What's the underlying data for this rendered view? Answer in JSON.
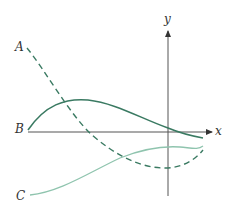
{
  "diagram": {
    "labels": {
      "curve_a": "A",
      "curve_b": "B",
      "curve_c": "C",
      "x_axis": "x",
      "y_axis": "y"
    },
    "colors": {
      "axis": "#555555",
      "curve_a": "#3a7a62",
      "curve_b": "#3a7a62",
      "curve_c": "#8fc4ae",
      "text": "#333333"
    },
    "curves": [
      {
        "name": "A",
        "style": "dashed",
        "description": "decreasing from top-left, minimum just right of y-axis below x-axis, then rising"
      },
      {
        "name": "B",
        "style": "solid",
        "description": "starts on x-axis left, rises to maximum, decreases crossing x-axis near y-axis"
      },
      {
        "name": "C",
        "style": "solid-light",
        "description": "starts low-left, rises to maximum just right of y-axis below x-axis"
      }
    ]
  }
}
